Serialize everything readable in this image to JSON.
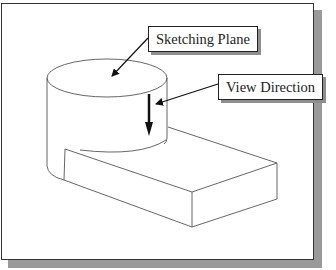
{
  "diagram": {
    "labels": {
      "sketching_plane": "Sketching Plane",
      "view_direction": "View Direction"
    },
    "colors": {
      "outline": "#555555",
      "arrow": "#111111",
      "frame_border": "#333333",
      "shadow": "#9a9a9a",
      "background": "#ffffff"
    },
    "shapes": [
      "cylinder",
      "rectangular-block"
    ]
  }
}
